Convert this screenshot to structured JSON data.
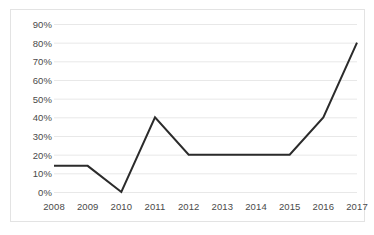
{
  "chart_data": {
    "type": "line",
    "title": "",
    "subtitle": "",
    "xlabel": "",
    "ylabel": "",
    "categories": [
      "2008",
      "2009",
      "2010",
      "2011",
      "2012",
      "2013",
      "2014",
      "2015",
      "2016",
      "2017"
    ],
    "values": [
      14,
      14,
      0,
      40,
      20,
      20,
      20,
      20,
      40,
      80
    ],
    "ytick_labels": [
      "0%",
      "10%",
      "20%",
      "30%",
      "40%",
      "50%",
      "60%",
      "70%",
      "80%",
      "90%"
    ],
    "ytick_values": [
      0,
      10,
      20,
      30,
      40,
      50,
      60,
      70,
      80,
      90
    ],
    "ylim": [
      0,
      90
    ],
    "grid": true,
    "grid_axis": "y",
    "legend": false,
    "legend_position": "none",
    "markers": false,
    "series": [
      {
        "name": "",
        "values": [
          14,
          14,
          0,
          40,
          20,
          20,
          20,
          20,
          40,
          80
        ]
      }
    ],
    "colors": {
      "line": "#2b2b2b",
      "grid": "#e8e8e8",
      "border": "#e3e3e3",
      "background": "#ffffff",
      "tick_text": "#4a4a4a"
    }
  }
}
